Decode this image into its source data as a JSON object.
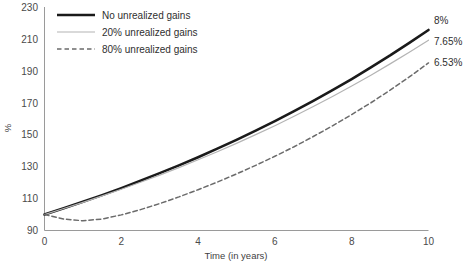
{
  "chart_data": {
    "type": "line",
    "title": "",
    "xlabel": "Time (in years)",
    "ylabel": "%",
    "xlim": [
      0,
      10
    ],
    "ylim": [
      90,
      230
    ],
    "xticks": [
      "0",
      "2",
      "4",
      "6",
      "8",
      "10"
    ],
    "xtick_values": [
      0,
      2,
      4,
      6,
      8,
      10
    ],
    "yticks": [
      "90",
      "110",
      "130",
      "150",
      "170",
      "190",
      "210",
      "230"
    ],
    "ytick_values": [
      90,
      110,
      130,
      150,
      170,
      190,
      210,
      230
    ],
    "grid": false,
    "legend_position": "top-left",
    "x": [
      0,
      0.5,
      1,
      1.5,
      2,
      2.5,
      3,
      3.5,
      4,
      4.5,
      5,
      5.5,
      6,
      6.5,
      7,
      7.5,
      8,
      8.5,
      9,
      9.5,
      10
    ],
    "series": [
      {
        "name": "No unrealized gains",
        "rate_label": "8%",
        "rate": 8.0,
        "color": "#1a1a1a",
        "style": "solid",
        "width": 2.6,
        "values": [
          100,
          103.9,
          108,
          112.2,
          116.6,
          121.2,
          126,
          130.9,
          136,
          141.4,
          146.9,
          152.7,
          158.7,
          164.9,
          171.4,
          178.1,
          185.1,
          192.4,
          199.9,
          207.8,
          215.9
        ]
      },
      {
        "name": "20% unrealized gains",
        "rate_label": "7.65%",
        "rate": 7.65,
        "color": "#b4b4b4",
        "style": "solid",
        "width": 1.2,
        "values": [
          100,
          103.8,
          107.7,
          111.7,
          115.9,
          120.3,
          124.8,
          129.5,
          134.4,
          139.4,
          144.7,
          150.2,
          155.8,
          161.7,
          167.8,
          174.1,
          180.7,
          187.5,
          194.6,
          201.9,
          209.5
        ]
      },
      {
        "name": "80% unrealized gains",
        "rate_label": "6.53%",
        "rate": 6.53,
        "color": "#6b6b6b",
        "style": "dashed",
        "width": 1.5,
        "values": [
          100,
          97.2,
          96.1,
          97.2,
          99.8,
          103.1,
          106.9,
          111.1,
          115.6,
          120.4,
          125.5,
          130.9,
          136.6,
          142.6,
          149,
          155.7,
          162.8,
          170.2,
          178.1,
          186.4,
          195.2
        ]
      }
    ],
    "end_labels": [
      "8%",
      "7.65%",
      "6.53%"
    ]
  },
  "legend": {
    "items": [
      {
        "label": "No unrealized gains"
      },
      {
        "label": "20% unrealized gains"
      },
      {
        "label": "80% unrealized gains"
      }
    ]
  },
  "axes": {
    "y_title": "%",
    "x_title": "Time (in years)"
  }
}
